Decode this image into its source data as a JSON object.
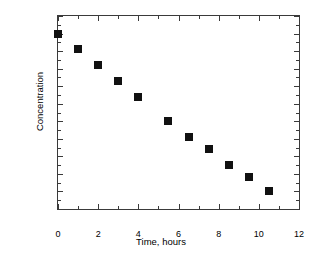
{
  "chart_data": {
    "type": "scatter",
    "title": "",
    "subtitle": "",
    "xlabel": "Time, hours",
    "ylabel": "Concentration",
    "xlim": [
      0,
      12
    ],
    "ylim": [
      0,
      1.1
    ],
    "grid": false,
    "legend": null,
    "legend_position": "none",
    "marker": "filled-square",
    "marker_color": "#111111",
    "axis_color": "#3a3a3a",
    "background_color": "#ffffff",
    "x_major_ticks": [
      0,
      2,
      4,
      6,
      8,
      10,
      12
    ],
    "x_minor_ticks": [
      1,
      3,
      5,
      7,
      9,
      11
    ],
    "x_tick_labels": [
      "0",
      "2",
      "4",
      "6",
      "8",
      "10",
      "12"
    ],
    "y_major_ticks": [
      0,
      0.1,
      0.2,
      0.3,
      0.4,
      0.5,
      0.6,
      0.7,
      0.8,
      0.9,
      1,
      1.1
    ],
    "y_tick_labels": [
      "0",
      "0.1",
      "0.2",
      "0.3",
      "0.4",
      "0.5",
      "0.6",
      "0.7",
      "0.8",
      "0.9",
      "1",
      "1.1"
    ],
    "x": [
      0,
      1,
      2,
      3,
      4,
      5.5,
      6.5,
      7.5,
      8.5,
      9.5,
      10.5
    ],
    "y": [
      1.0,
      0.91,
      0.82,
      0.73,
      0.64,
      0.5,
      0.41,
      0.34,
      0.25,
      0.18,
      0.1
    ],
    "points": [
      {
        "x": 0,
        "y": 1.0
      },
      {
        "x": 1,
        "y": 0.91
      },
      {
        "x": 2,
        "y": 0.82
      },
      {
        "x": 3,
        "y": 0.73
      },
      {
        "x": 4,
        "y": 0.64
      },
      {
        "x": 5.5,
        "y": 0.5
      },
      {
        "x": 6.5,
        "y": 0.41
      },
      {
        "x": 7.5,
        "y": 0.34
      },
      {
        "x": 8.5,
        "y": 0.25
      },
      {
        "x": 9.5,
        "y": 0.18
      },
      {
        "x": 10.5,
        "y": 0.1
      }
    ]
  }
}
